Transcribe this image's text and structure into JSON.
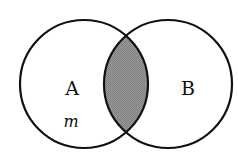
{
  "diagram": {
    "type": "venn",
    "colors": {
      "background": "#ffffff",
      "stroke": "#111111",
      "intersection_fill": "#8c8c8c"
    },
    "sets": [
      {
        "id": "A",
        "label": "A",
        "cx": 84,
        "cy": 84,
        "r": 64
      },
      {
        "id": "B",
        "label": "B",
        "cx": 168,
        "cy": 84,
        "r": 64
      }
    ],
    "shaded_region": "A ∩ B",
    "element_labels": [
      {
        "text": "m",
        "in_set": "A"
      }
    ]
  }
}
